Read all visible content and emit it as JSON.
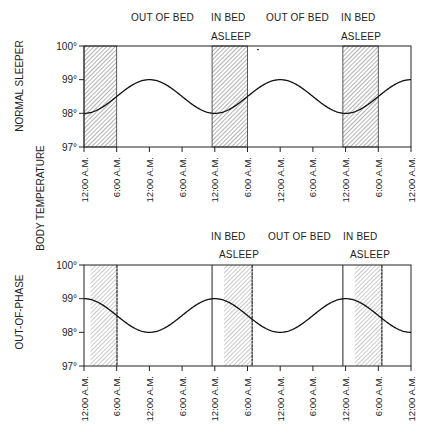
{
  "figure": {
    "axis_title": "BODY TEMPERATURE"
  },
  "chart_data": [
    {
      "type": "line",
      "title": "NORMAL SLEEPER",
      "ylabel": "BODY TEMPERATURE",
      "xlabel": "",
      "ylim": [
        97,
        100
      ],
      "yticks": [
        "97°",
        "98°",
        "99°",
        "100°"
      ],
      "x_tick_labels": [
        "12:00 A.M.",
        "6:00 A.M.",
        "12:00 A.M.",
        "6:00 A.M.",
        "12:00 A.M.",
        "6:00 A.M.",
        "12:00 A.M.",
        "6:00 A.M.",
        "12:00 A.M.",
        "6:00 A.M.",
        "12:00 A.M."
      ],
      "x_hours": [
        0,
        6,
        12,
        18,
        24,
        30,
        36,
        42,
        48,
        54,
        60
      ],
      "series": [
        {
          "name": "Body temperature",
          "x": [
            0,
            6,
            12,
            18,
            24,
            30,
            36,
            42,
            48,
            54,
            60
          ],
          "values": [
            98.0,
            98.5,
            99.0,
            98.5,
            98.0,
            98.5,
            99.0,
            98.5,
            98.0,
            98.5,
            99.0
          ]
        }
      ],
      "phase": "min",
      "shaded_regions": [
        {
          "label": "ASLEEP",
          "start_h": 0,
          "end_h": 6,
          "style": "hatched"
        },
        {
          "label": "ASLEEP",
          "start_h": 23.5,
          "end_h": 30,
          "style": "hatched"
        },
        {
          "label": "ASLEEP",
          "start_h": 47.5,
          "end_h": 54,
          "style": "hatched"
        }
      ],
      "annotations": [
        {
          "text": "OUT OF BED",
          "row": 1,
          "x": 131
        },
        {
          "text": "IN BED",
          "row": 1,
          "x": 211
        },
        {
          "text": "OUT OF BED",
          "row": 1,
          "x": 266
        },
        {
          "text": "IN BED",
          "row": 1,
          "x": 341
        },
        {
          "text": "ASLEEP",
          "row": 2,
          "x": 211
        },
        {
          "text": "ASLEEP",
          "row": 2,
          "x": 341
        }
      ],
      "grid": false,
      "legend": "none"
    },
    {
      "type": "line",
      "title": "OUT-OF-PHASE",
      "ylabel": "BODY TEMPERATURE",
      "xlabel": "",
      "ylim": [
        97,
        100
      ],
      "yticks": [
        "97°",
        "98°",
        "99°",
        "100°"
      ],
      "x_tick_labels": [
        "12:00 A.M.",
        "6:00 A.M.",
        "12:00 A.M.",
        "6:00 A.M.",
        "12:00 A.M.",
        "6:00 A.M.",
        "12:00 A.M.",
        "6:00 A.M.",
        "12:00 A.M.",
        "6:00 A.M.",
        "12:00 A.M."
      ],
      "x_hours": [
        0,
        6,
        12,
        18,
        24,
        30,
        36,
        42,
        48,
        54,
        60
      ],
      "series": [
        {
          "name": "Body temperature",
          "x": [
            0,
            6,
            12,
            18,
            24,
            30,
            36,
            42,
            48,
            54,
            60
          ],
          "values": [
            99.0,
            98.5,
            98.0,
            98.5,
            99.0,
            98.5,
            98.0,
            98.5,
            99.0,
            98.5,
            98.0
          ]
        }
      ],
      "phase": "max",
      "in_bed_lines_h": [
        23.5,
        47.5
      ],
      "shaded_regions": [
        {
          "label": "ASLEEP",
          "start_h": 1.2,
          "end_h": 6.2,
          "style": "hatched-light"
        },
        {
          "label": "ASLEEP",
          "start_h": 25.7,
          "end_h": 31,
          "style": "hatched-light"
        },
        {
          "label": "ASLEEP",
          "start_h": 49.7,
          "end_h": 54.8,
          "style": "hatched-light"
        }
      ],
      "annotations": [
        {
          "text": "IN BED",
          "row": 1,
          "x": 211
        },
        {
          "text": "OUT OF BED",
          "row": 1,
          "x": 268
        },
        {
          "text": "IN BED",
          "row": 1,
          "x": 343
        },
        {
          "text": "ASLEEP",
          "row": 2,
          "x": 219
        },
        {
          "text": "ASLEEP",
          "row": 2,
          "x": 350
        }
      ],
      "grid": false,
      "legend": "none"
    }
  ]
}
